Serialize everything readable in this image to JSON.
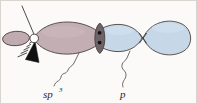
{
  "figure": {
    "background_color": "#fbfaf8",
    "border_color": "#d8d5cf",
    "width": 197,
    "height": 104
  },
  "labels": {
    "sp3": {
      "base": "sp",
      "superscript": "3",
      "full": "sp3",
      "x": 42,
      "y": 96
    },
    "p": {
      "text": "p",
      "x": 120,
      "y": 96
    }
  },
  "orbitals": {
    "sp3_hybrid": {
      "name": "sp3 hybrid orbital",
      "color": "#c3aeb3",
      "outline_color": "#4a4340",
      "front_lobe": {
        "description": "large front lobe pointing right",
        "fill": "#c3aeb3"
      },
      "back_lobe": {
        "description": "small back lobe pointing left",
        "fill": "#c0abb0"
      }
    },
    "p_orbital": {
      "name": "p orbital",
      "color": "#c6d7e8",
      "outline_color": "#4a4340",
      "left_lobe": {
        "description": "left lobe of p orbital",
        "fill": "#c6d7e8"
      },
      "right_lobe": {
        "description": "right lobe of p orbital",
        "fill": "#c6d7e8"
      },
      "node": {
        "description": "nodal pinch point between lobes"
      }
    }
  },
  "overlap": {
    "name": "sigma bond overlap region",
    "fill": "#6d6369",
    "electron_dots": 2,
    "dot_color": "#1a1614"
  },
  "atom_center": {
    "name": "carbon atom center",
    "fill": "#fdfcfa",
    "stroke": "#3a3533"
  },
  "bonds": [
    {
      "type": "plain-line",
      "name": "plain-bond-up-left",
      "direction": "up-left",
      "color": "#3a3533"
    },
    {
      "type": "hashed-wedge",
      "name": "hashed-bond-down-left",
      "direction": "down-left",
      "color": "#55504d",
      "hash_count": 5
    },
    {
      "type": "solid-wedge",
      "name": "solid-wedge-bond-down",
      "direction": "down",
      "color": "#111010"
    }
  ],
  "leaders": [
    {
      "name": "sp3-leader",
      "style": "squiggle",
      "from_label": "sp3",
      "to_target": "sp3 front lobe"
    },
    {
      "name": "p-leader",
      "style": "squiggle",
      "from_label": "p",
      "to_target": "p orbital left lobe"
    }
  ]
}
